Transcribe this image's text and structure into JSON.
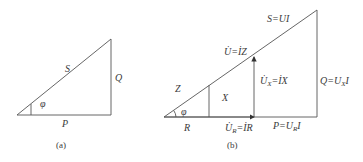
{
  "figure_a": {
    "caption": "(a)",
    "labels": {
      "hypotenuse": "S",
      "vertical": "Q",
      "base": "P",
      "angle": "φ"
    }
  },
  "figure_b": {
    "caption": "(b)",
    "labels": {
      "apparent_power": "S=UI",
      "voltage": "U̇=İZ",
      "reactive_voltage": "U̇X=İX",
      "reactive_power": "Q=UXI",
      "impedance": "Z",
      "reactance": "X",
      "angle": "φ",
      "resistance": "R",
      "resistive_voltage": "U̇R=İR",
      "active_power": "P=URI"
    }
  },
  "colors": {
    "line": "#555555",
    "text": "#3a3a3a",
    "background": "#ffffff"
  }
}
